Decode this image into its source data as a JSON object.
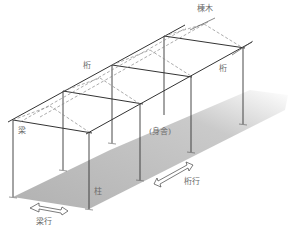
{
  "diagram": {
    "type": "isometric timber-frame structure",
    "labels": {
      "ridge_beam": "棟木",
      "purlin_left": "桁",
      "purlin_right": "桁",
      "beam": "梁",
      "core": "(身舎)",
      "pillar": "柱",
      "girder_direction": "桁行",
      "beam_direction": "梁行"
    },
    "colors": {
      "line": "#333333",
      "dashed": "#888888",
      "shadow": "#b8b8b8",
      "label": "#6a6a6a"
    }
  }
}
